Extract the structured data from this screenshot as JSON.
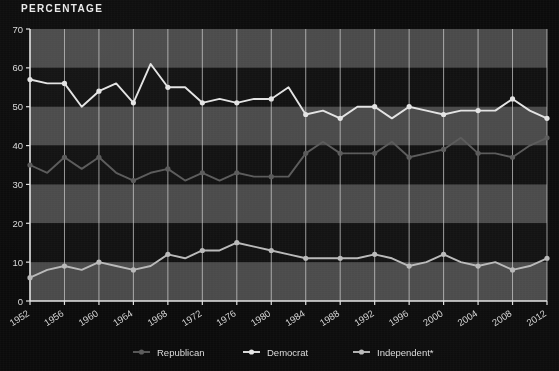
{
  "header": {
    "title": "PERCENTAGE"
  },
  "chart_data": {
    "type": "line",
    "title": "PERCENTAGE",
    "xlabel": "",
    "ylabel": "PERCENTAGE",
    "ylim": [
      0,
      70
    ],
    "ytick_step": 10,
    "yticks": [
      "0",
      "10",
      "20",
      "30",
      "40",
      "50",
      "60",
      "70"
    ],
    "grid": true,
    "grid_bands": true,
    "legend_position": "bottom",
    "x_start": 1952,
    "x_end": 2012,
    "x_interval": 2,
    "categories": [
      "1952",
      "1954",
      "1956",
      "1958",
      "1960",
      "1962",
      "1964",
      "1966",
      "1968",
      "1970",
      "1972",
      "1974",
      "1976",
      "1978",
      "1980",
      "1982",
      "1984",
      "1986",
      "1988",
      "1990",
      "1992",
      "1994",
      "1996",
      "1998",
      "2000",
      "2002",
      "2004",
      "2006",
      "2008",
      "2010",
      "2012"
    ],
    "tick_labels": [
      "1952",
      "1956",
      "1960",
      "1964",
      "1968",
      "1972",
      "1976",
      "1980",
      "1984",
      "1988",
      "1992",
      "1996",
      "2000",
      "2004",
      "2008",
      "2012"
    ],
    "series": [
      {
        "name": "Democrat",
        "color": "#e3e3e3",
        "marker": "circle",
        "values": [
          57,
          56,
          56,
          50,
          54,
          56,
          51,
          61,
          55,
          55,
          51,
          52,
          51,
          52,
          52,
          55,
          48,
          49,
          47,
          50,
          50,
          47,
          50,
          49,
          48,
          49,
          49,
          49,
          52,
          49,
          47
        ]
      },
      {
        "name": "Republican",
        "color": "#5a5a5a",
        "marker": "circle",
        "values": [
          35,
          33,
          37,
          34,
          37,
          33,
          31,
          33,
          34,
          31,
          33,
          31,
          33,
          32,
          32,
          32,
          38,
          41,
          38,
          38,
          38,
          41,
          37,
          38,
          39,
          42,
          38,
          38,
          37,
          40,
          42
        ]
      },
      {
        "name": "Independent*",
        "color": "#b9b9b9",
        "marker": "circle",
        "values": [
          6,
          8,
          9,
          8,
          10,
          9,
          8,
          9,
          12,
          11,
          13,
          13,
          15,
          14,
          13,
          12,
          11,
          11,
          11,
          11,
          12,
          11,
          9,
          10,
          12,
          10,
          9,
          10,
          8,
          9,
          11
        ]
      }
    ]
  },
  "legend": {
    "items": [
      {
        "label": "Republican",
        "color": "#5a5a5a"
      },
      {
        "label": "Democrat",
        "color": "#e3e3e3"
      },
      {
        "label": "Independent*",
        "color": "#b9b9b9"
      }
    ]
  }
}
